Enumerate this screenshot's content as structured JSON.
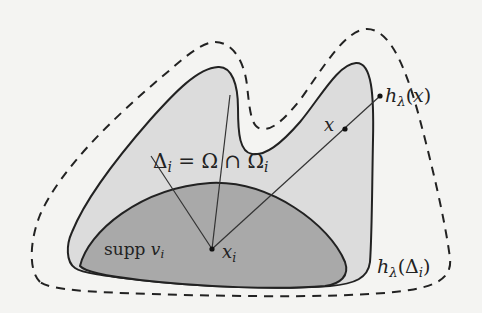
{
  "figure": {
    "colors": {
      "background": "#f4f4f2",
      "omega_fill": "#dcdcdc",
      "support_fill": "#a9a9a9",
      "stroke": "#222222"
    },
    "labels": {
      "delta_eq": {
        "delta": "Δ",
        "delta_sub": "i",
        "eq": " = Ω ∩ Ω",
        "omega_sub": "i"
      },
      "supp": {
        "word": "supp ",
        "var": "v",
        "sub": "i"
      },
      "xi": {
        "var": "x",
        "sub": "i"
      },
      "x": {
        "var": "x"
      },
      "h_x": {
        "h": "h",
        "sub": "λ",
        "arg_open": "(",
        "arg": "x",
        "arg_close": ")"
      },
      "h_delta": {
        "h": "h",
        "sub": "λ",
        "arg_open": "(Δ",
        "arg_sub": "i",
        "arg_close": ")"
      }
    },
    "points": {
      "x_i": [
        212,
        249
      ],
      "x": [
        345,
        129
      ],
      "h_lambda_x": [
        380,
        96
      ]
    }
  }
}
